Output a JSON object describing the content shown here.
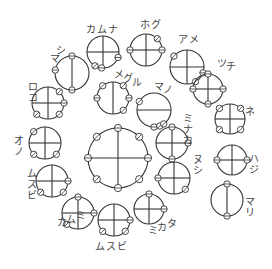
{
  "diagram": {
    "title": "",
    "colors": {
      "stroke": "#333333",
      "label": "#444444",
      "background": "#ffffff"
    },
    "nodes": [
      {
        "id": "center",
        "label": "",
        "cx": 118,
        "cy": 158,
        "r": 30,
        "cross": "both",
        "knobs": [
          [
            0,
            "c"
          ],
          [
            45,
            "s"
          ],
          [
            90,
            "c"
          ],
          [
            135,
            "s"
          ],
          [
            180,
            "c"
          ],
          [
            225,
            "s"
          ],
          [
            270,
            "c"
          ],
          [
            315,
            "s"
          ]
        ],
        "lx": 0,
        "ly": 0,
        "vertical": false
      },
      {
        "id": "kamuna",
        "label": "カムナ",
        "cx": 103,
        "cy": 52,
        "r": 16,
        "cross": "both",
        "knobs": [
          [
            20,
            "c"
          ],
          [
            120,
            "s"
          ],
          [
            95,
            "c"
          ]
        ],
        "lx": 86,
        "ly": 33,
        "vertical": false
      },
      {
        "id": "hogu",
        "label": "ホグ",
        "cx": 146,
        "cy": 50,
        "r": 16,
        "cross": "both",
        "knobs": [
          [
            -45,
            "s"
          ],
          [
            0,
            "c"
          ],
          [
            180,
            "c"
          ]
        ],
        "lx": 140,
        "ly": 28,
        "vertical": false
      },
      {
        "id": "ame",
        "label": "アメ",
        "cx": 187,
        "cy": 67,
        "r": 17,
        "cross": "both",
        "knobs": [
          [
            -140,
            "s"
          ],
          [
            20,
            "c"
          ],
          [
            60,
            "s"
          ]
        ],
        "lx": 178,
        "ly": 43,
        "vertical": false
      },
      {
        "id": "mashi",
        "label": "マシ",
        "cx": 72,
        "cy": 73,
        "r": 17,
        "cross": "v",
        "knobs": [
          [
            -90,
            "c"
          ],
          [
            90,
            "c"
          ],
          [
            190,
            "c"
          ]
        ],
        "lx": 0,
        "ly": 0,
        "vertical": true,
        "angle": -55,
        "tx": 50,
        "ty": 62
      },
      {
        "id": "megu",
        "label": "メグル",
        "cx": 113,
        "cy": 98,
        "r": 16,
        "cross": "v",
        "knobs": [
          [
            -130,
            "s"
          ],
          [
            -50,
            "s"
          ],
          [
            180,
            "c"
          ],
          [
            0,
            "c"
          ],
          [
            50,
            "s"
          ]
        ],
        "lx": 0,
        "ly": 0,
        "vertical": true,
        "angle": 25,
        "tx": 114,
        "ty": 78
      },
      {
        "id": "mano",
        "label": "マノ",
        "cx": 154,
        "cy": 110,
        "r": 17,
        "cross": "h",
        "knobs": [
          [
            -150,
            "s"
          ],
          [
            90,
            "c"
          ],
          [
            70,
            "s"
          ],
          [
            55,
            "s"
          ]
        ],
        "lx": 0,
        "ly": 0,
        "vertical": true,
        "angle": 20,
        "tx": 154,
        "ty": 90
      },
      {
        "id": "tsuchi",
        "label": "ツチ",
        "cx": 208,
        "cy": 89,
        "r": 15,
        "cross": "both",
        "knobs": [
          [
            -90,
            "c"
          ],
          [
            0,
            "c"
          ],
          [
            180,
            "c"
          ],
          [
            90,
            "c"
          ]
        ],
        "lx": 0,
        "ly": 0,
        "vertical": true,
        "angle": 20,
        "tx": 217,
        "ty": 67
      },
      {
        "id": "koro",
        "label": "コロ",
        "cx": 48,
        "cy": 103,
        "r": 16,
        "cross": "both",
        "knobs": [
          [
            -45,
            "s"
          ],
          [
            0,
            "c"
          ],
          [
            45,
            "s"
          ],
          [
            135,
            "s"
          ]
        ],
        "lx": 0,
        "ly": 0,
        "vertical": true,
        "angle": -90,
        "tx": 28,
        "ty": 101
      },
      {
        "id": "ne",
        "label": "ネ",
        "cx": 230,
        "cy": 119,
        "r": 15,
        "cross": "both",
        "knobs": [
          [
            -135,
            "s"
          ],
          [
            -45,
            "s"
          ],
          [
            135,
            "s"
          ],
          [
            45,
            "s"
          ]
        ],
        "lx": 245,
        "ly": 115,
        "vertical": false
      },
      {
        "id": "minaka",
        "label": "ミナカ",
        "cx": 172,
        "cy": 143,
        "r": 16,
        "cross": "both",
        "knobs": [
          [
            -90,
            "c"
          ],
          [
            0,
            "c"
          ],
          [
            90,
            "c"
          ]
        ],
        "lx": 0,
        "ly": 0,
        "vertical": true,
        "angle": 0,
        "tx": 183,
        "ty": 122
      },
      {
        "id": "ono",
        "label": "オノ",
        "cx": 45,
        "cy": 143,
        "r": 16,
        "cross": "both",
        "knobs": [
          [
            -135,
            "s"
          ],
          [
            135,
            "s"
          ],
          [
            45,
            "s"
          ]
        ],
        "lx": 0,
        "ly": 0,
        "vertical": true,
        "angle": 0,
        "tx": 14,
        "ty": 144
      },
      {
        "id": "hashi",
        "label": "ハジ",
        "cx": 232,
        "cy": 160,
        "r": 15,
        "cross": "both",
        "knobs": [
          [
            180,
            "c"
          ],
          [
            0,
            "c"
          ]
        ],
        "lx": 0,
        "ly": 0,
        "vertical": true,
        "angle": 0,
        "tx": 249,
        "ty": 162
      },
      {
        "id": "musubi1",
        "label": "ムスビ",
        "cx": 52,
        "cy": 181,
        "r": 16,
        "cross": "both",
        "knobs": [
          [
            0,
            "c"
          ],
          [
            135,
            "s"
          ],
          [
            45,
            "s"
          ]
        ],
        "lx": 0,
        "ly": 0,
        "vertical": true,
        "angle": 0,
        "tx": 27,
        "ty": 177
      },
      {
        "id": "nushi",
        "label": "ヌシ",
        "cx": 174,
        "cy": 178,
        "r": 16,
        "cross": "both",
        "knobs": [
          [
            180,
            "c"
          ],
          [
            45,
            "s"
          ]
        ],
        "lx": 0,
        "ly": 0,
        "vertical": true,
        "angle": 0,
        "tx": 193,
        "ty": 163
      },
      {
        "id": "mari",
        "label": "マリ",
        "cx": 227,
        "cy": 200,
        "r": 16,
        "cross": "v",
        "knobs": [
          [
            -90,
            "c"
          ],
          [
            90,
            "c"
          ]
        ],
        "lx": 0,
        "ly": 0,
        "vertical": true,
        "angle": 0,
        "tx": 245,
        "ty": 205
      },
      {
        "id": "kamumi",
        "label": "カムミ",
        "cx": 78,
        "cy": 213,
        "r": 16,
        "cross": "both",
        "knobs": [
          [
            -90,
            "c"
          ],
          [
            0,
            "c"
          ],
          [
            135,
            "s"
          ]
        ],
        "lx": 0,
        "ly": 0,
        "vertical": true,
        "angle": -20,
        "tx": 57,
        "ty": 226
      },
      {
        "id": "musubi2",
        "label": "ムスビ",
        "cx": 114,
        "cy": 220,
        "r": 16,
        "cross": "both",
        "knobs": [
          [
            0,
            "c"
          ],
          [
            135,
            "s"
          ],
          [
            45,
            "s"
          ]
        ],
        "lx": 95,
        "ly": 250,
        "vertical": false
      },
      {
        "id": "mikata",
        "label": "ミカタ",
        "cx": 149,
        "cy": 209,
        "r": 15,
        "cross": "both",
        "knobs": [
          [
            -90,
            "c"
          ],
          [
            0,
            "c"
          ]
        ],
        "lx": 0,
        "ly": 0,
        "vertical": true,
        "angle": -20,
        "tx": 148,
        "ty": 234
      }
    ]
  }
}
